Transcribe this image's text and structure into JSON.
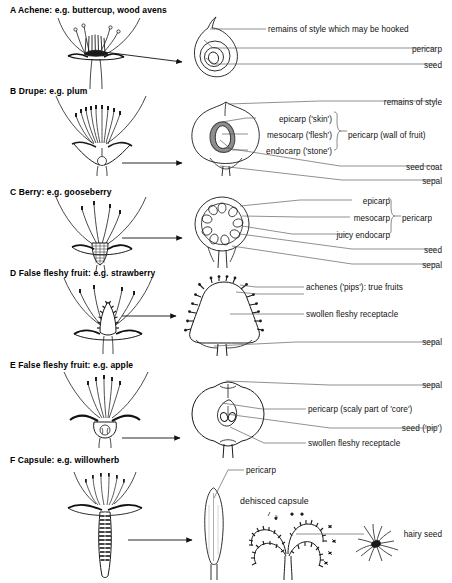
{
  "document": {
    "title": "Fruit types: structure diagrams"
  },
  "sections": [
    {
      "id": "a",
      "title": "A  Achene: e.g. buttercup, wood avens",
      "flower_name": "buttercup-flower-longitudinal-section",
      "fruit_name": "achene-fruit-section",
      "labels": [
        {
          "text": "remains of style which may be hooked"
        },
        {
          "text": "pericarp"
        },
        {
          "text": "seed"
        }
      ]
    },
    {
      "id": "b",
      "title": "B  Drupe: e.g. plum",
      "flower_name": "plum-flower-longitudinal-section",
      "fruit_name": "drupe-fruit-section",
      "labels": [
        {
          "text": "remains of style"
        },
        {
          "text": "epicarp ('skin')"
        },
        {
          "text": "mesocarp ('flesh')"
        },
        {
          "text": "endocarp ('stone')"
        },
        {
          "text": "pericarp (wall of fruit)"
        },
        {
          "text": "seed coat"
        },
        {
          "text": "sepal"
        }
      ],
      "bracket_label": "pericarp (wall of fruit)"
    },
    {
      "id": "c",
      "title": "C  Berry: e.g. gooseberry",
      "flower_name": "gooseberry-flower-longitudinal-section",
      "fruit_name": "berry-fruit-transverse-section",
      "labels": [
        {
          "text": "epicarp"
        },
        {
          "text": "mesocarp"
        },
        {
          "text": "juicy endocarp"
        },
        {
          "text": "pericarp"
        },
        {
          "text": "seed"
        },
        {
          "text": "sepal"
        }
      ],
      "bracket_label": "pericarp"
    },
    {
      "id": "d",
      "title": "D  False fleshy fruit: e.g. strawberry",
      "flower_name": "strawberry-flower-longitudinal-section",
      "fruit_name": "strawberry-fruit-section",
      "labels": [
        {
          "text": "achenes ('pips'): true fruits"
        },
        {
          "text": "swollen fleshy receptacle"
        },
        {
          "text": "sepal"
        }
      ]
    },
    {
      "id": "e",
      "title": "E  False fleshy fruit: e.g. apple",
      "flower_name": "apple-flower-longitudinal-section",
      "fruit_name": "apple-fruit-section",
      "labels": [
        {
          "text": "sepal"
        },
        {
          "text": "pericarp (scaly part of 'core')"
        },
        {
          "text": "seed ('pip')"
        },
        {
          "text": "swollen fleshy receptacle"
        }
      ]
    },
    {
      "id": "f",
      "title": "F  Capsule: e.g. willowherb",
      "flower_name": "willowherb-flower-longitudinal-section",
      "fruit_name": "willowherb-capsule",
      "labels": [
        {
          "text": "pericarp"
        },
        {
          "text": "dehisced capsule"
        },
        {
          "text": "hairy seed"
        }
      ]
    }
  ],
  "style": {
    "ink": "#000000",
    "leader": "#555555",
    "fill": "#ffffff",
    "shade": "#9a9a9a",
    "background": "#ffffff"
  }
}
